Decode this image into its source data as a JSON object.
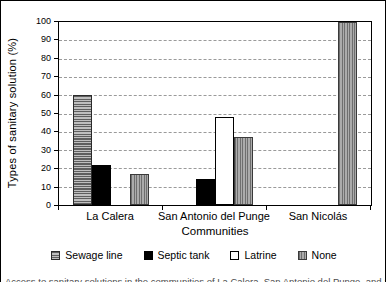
{
  "chart_data": {
    "type": "bar",
    "title": "",
    "xlabel": "Communities",
    "ylabel": "Types of sanitary solution (%)",
    "ylim": [
      0,
      100
    ],
    "ytick_step": 10,
    "grid": "horizontal-dashed",
    "legend_position": "bottom",
    "categories": [
      "La Calera",
      "San Antonio del Punge",
      "San Nicolás"
    ],
    "series": [
      {
        "name": "Sewage line",
        "pattern": "horizontal-stripes",
        "color": "#9a9a9a",
        "values": [
          60,
          0,
          0
        ]
      },
      {
        "name": "Septic tank",
        "pattern": "solid",
        "color": "#000000",
        "values": [
          22,
          14,
          0
        ]
      },
      {
        "name": "Latrine",
        "pattern": "outline-white",
        "color": "#ffffff",
        "values": [
          0,
          48,
          0
        ]
      },
      {
        "name": "None",
        "pattern": "vertical-stripes",
        "color": "#9a9a9a",
        "values": [
          17,
          37,
          100
        ]
      }
    ]
  },
  "caption_clipped": "Access to sanitary solutions in the communities of La Calera, San Antonio del Punge, and San Nicolás"
}
